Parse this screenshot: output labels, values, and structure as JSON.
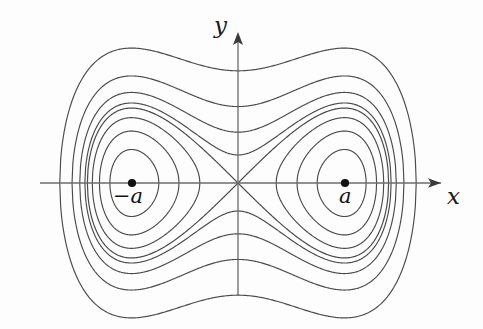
{
  "figure": {
    "kind": "phase-portrait",
    "background_color": "#fdfdfd",
    "curve_color": "#4a4a4a",
    "axis_color": "#6b6b6b",
    "marker_color": "#111111",
    "width": 483,
    "height": 329
  },
  "axes": {
    "x_label": "x",
    "y_label": "y",
    "origin_px": {
      "x": 238,
      "y": 183
    },
    "x_axis_px": {
      "x1": 40,
      "x2": 441,
      "y": 183
    },
    "y_axis_px": {
      "y1": 295,
      "y2": 32,
      "x": 238
    },
    "x_arrow": "arrow-right",
    "y_arrow": "arrow-up"
  },
  "fixed_points": [
    {
      "name": "left-center",
      "label": "−a",
      "px": {
        "x": 132,
        "y": 183
      },
      "type": "center"
    },
    {
      "name": "right-center",
      "label": "a",
      "px": {
        "x": 345,
        "y": 183
      },
      "type": "center"
    },
    {
      "name": "origin-saddle",
      "label": "",
      "px": {
        "x": 238,
        "y": 183
      },
      "type": "saddle"
    }
  ],
  "chart_data": {
    "type": "line",
    "title": "",
    "xlabel": "x",
    "ylabel": "y",
    "grid": false,
    "legend": null,
    "a_value": 1.0,
    "scale_px_per_unit": {
      "x": 106.5,
      "y": 106.0
    },
    "separatrix_level": 0.0,
    "inner_levels": [
      -0.2,
      -0.13,
      -0.06
    ],
    "outer_levels": [
      0.035,
      0.115,
      0.26,
      0.56
    ],
    "x_axis_crossings_left_px": [
      53,
      62,
      70,
      76,
      81,
      86,
      91,
      96
    ],
    "x_axis_crossings_right_px": [
      371,
      378,
      384,
      389,
      394,
      399,
      407,
      416
    ],
    "y_axis_crossings_upper_px": [
      77,
      94,
      110,
      127
    ],
    "y_axis_crossings_lower_px": [
      239,
      256,
      272,
      289
    ],
    "outer_bbox_px": {
      "left": 52,
      "right": 424,
      "top": 77,
      "bottom": 289
    }
  }
}
